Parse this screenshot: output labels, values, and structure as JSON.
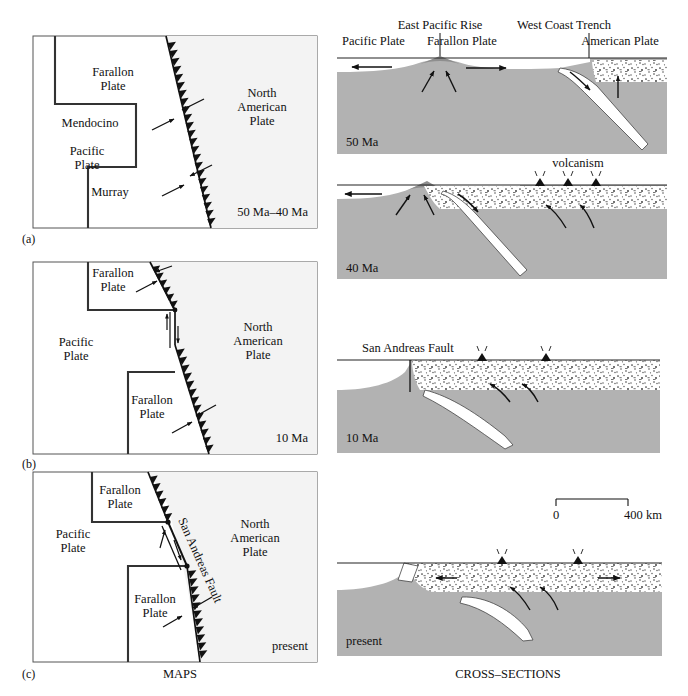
{
  "figure": {
    "column_captions": {
      "maps": "MAPS",
      "cross_sections": "CROSS–SECTIONS"
    }
  },
  "maps": [
    {
      "id": "a",
      "panel_label": "(a)",
      "time_label": "50 Ma–40 Ma",
      "plates": [
        {
          "name": "Farallon Plate",
          "line1": "Farallon",
          "line2": "Plate"
        },
        {
          "name": "Pacific Plate",
          "line1": "Pacific",
          "line2": "Plate"
        },
        {
          "name": "North American Plate",
          "line1": "North",
          "line2": "American",
          "line3": "Plate"
        }
      ],
      "fracture_zones": [
        "Mendocino",
        "Murray"
      ],
      "boundary_type": "trench"
    },
    {
      "id": "b",
      "panel_label": "(b)",
      "time_label": "10 Ma",
      "plates": [
        {
          "name": "Farallon Plate north",
          "line1": "Farallon",
          "line2": "Plate"
        },
        {
          "name": "Pacific Plate",
          "line1": "Pacific",
          "line2": "Plate"
        },
        {
          "name": "Farallon Plate south",
          "line1": "Farallon",
          "line2": "Plate"
        },
        {
          "name": "North American Plate",
          "line1": "North",
          "line2": "American",
          "line3": "Plate"
        }
      ],
      "fracture_zones": [],
      "boundary_type": "trench + transform"
    },
    {
      "id": "c",
      "panel_label": "(c)",
      "time_label": "present",
      "plates": [
        {
          "name": "Farallon Plate north",
          "line1": "Farallon",
          "line2": "Plate"
        },
        {
          "name": "Pacific Plate",
          "line1": "Pacific",
          "line2": "Plate"
        },
        {
          "name": "Farallon Plate south",
          "line1": "Farallon",
          "line2": "Plate"
        },
        {
          "name": "North American Plate",
          "line1": "North",
          "line2": "American",
          "line3": "Plate"
        }
      ],
      "fault_label": "San Andreas Fault",
      "boundary_type": "transform + trench"
    }
  ],
  "cross_sections": {
    "header_labels": {
      "pacific_plate": "Pacific Plate",
      "east_pacific_rise": "East Pacific Rise",
      "farallon_plate": "Farallon Plate",
      "west_coast_trench": "West Coast Trench",
      "american_plate": "American Plate"
    },
    "panels": [
      {
        "id": "xs-50ma",
        "time_label": "50 Ma",
        "annotations": []
      },
      {
        "id": "xs-40ma",
        "time_label": "40 Ma",
        "annotations": [
          "volcanism"
        ]
      },
      {
        "id": "xs-10ma",
        "time_label": "10 Ma",
        "annotations": [
          "San Andreas Fault"
        ]
      },
      {
        "id": "xs-present",
        "time_label": "present",
        "annotations": []
      }
    ],
    "scale_bar": {
      "left_label": "0",
      "right_label": "400 km"
    }
  },
  "colors": {
    "mantle_gray": "#b2b2b2",
    "ocean_white": "#ffffff",
    "continent_stipple_bg": "#ffffff",
    "line_black": "#1a1a1a",
    "plate_fill_light": "#f7f7f7",
    "na_plate_fill": "#f2f2f2"
  }
}
